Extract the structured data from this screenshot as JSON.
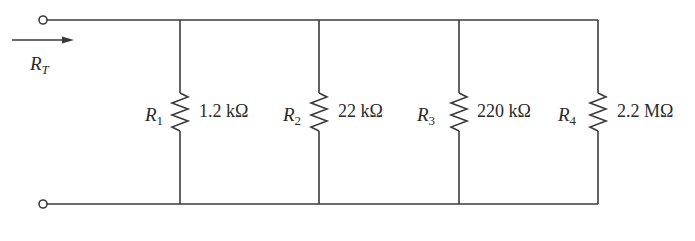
{
  "diagram": {
    "type": "parallel-resistor-network",
    "input_label": {
      "main": "R",
      "sub": "T"
    },
    "line_color": "#3a3a3a",
    "resistors": [
      {
        "name": "R",
        "sub": "1",
        "value": "1.2 kΩ",
        "x": 180
      },
      {
        "name": "R",
        "sub": "2",
        "value": "22 kΩ",
        "x": 319
      },
      {
        "name": "R",
        "sub": "3",
        "value": "220 kΩ",
        "x": 459
      },
      {
        "name": "R",
        "sub": "4",
        "value": "2.2 MΩ",
        "x": 598
      }
    ]
  }
}
